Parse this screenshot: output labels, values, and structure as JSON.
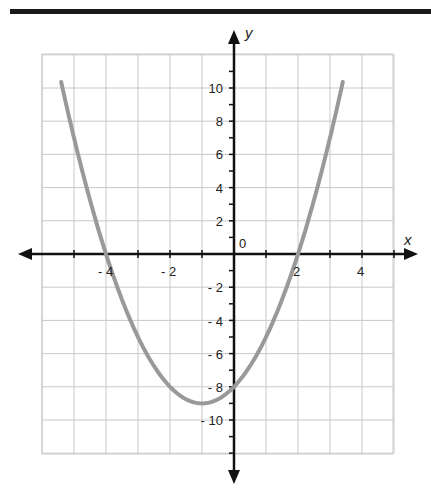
{
  "chart_data": {
    "type": "line",
    "title": "",
    "function": "y = x^2 + 2x - 8",
    "xlabel": "x",
    "ylabel": "y",
    "xlim": [
      -5.5,
      5.5
    ],
    "ylim": [
      -12,
      12
    ],
    "grid": true,
    "x_ticks": [
      -4,
      -2,
      2,
      4
    ],
    "x_tick_labels": [
      "- 4",
      "- 2",
      "2",
      "4"
    ],
    "y_ticks": [
      10,
      8,
      6,
      4,
      2,
      -2,
      -4,
      -6,
      -8,
      -10
    ],
    "y_tick_labels": [
      "10",
      "8",
      "6",
      "4",
      "2",
      "- 2",
      "- 4",
      "- 6",
      "- 8",
      "- 10"
    ],
    "origin_label": "0",
    "series": [
      {
        "name": "parabola",
        "color": "#999999",
        "x": [
          -5.4,
          -5,
          -4.5,
          -4,
          -3.5,
          -3,
          -2.5,
          -2,
          -1.5,
          -1,
          -0.5,
          0,
          0.5,
          1,
          1.5,
          2,
          2.5,
          3,
          3.4
        ],
        "y": [
          10.36,
          7,
          3.25,
          0,
          -2.75,
          -5,
          -6.75,
          -8,
          -8.75,
          -9,
          -8.75,
          -8,
          -6.75,
          -5,
          -2.75,
          0,
          3.25,
          7,
          10.36
        ]
      }
    ],
    "key_points": {
      "vertex": [
        -1,
        -9
      ],
      "x_intercepts": [
        -4,
        2
      ],
      "y_intercept": -8
    }
  },
  "labels": {
    "x_axis": "x",
    "y_axis": "y",
    "origin": "0",
    "x_ticks": [
      "- 4",
      "- 2",
      "2",
      "4"
    ],
    "y_ticks": [
      "10",
      "8",
      "6",
      "4",
      "2",
      "- 2",
      "- 4",
      "- 6",
      "- 8",
      "- 10"
    ]
  },
  "colors": {
    "curve": "#999999",
    "grid": "#c8c8c8",
    "axis": "#111111",
    "topbar": "#1a1a1a"
  }
}
